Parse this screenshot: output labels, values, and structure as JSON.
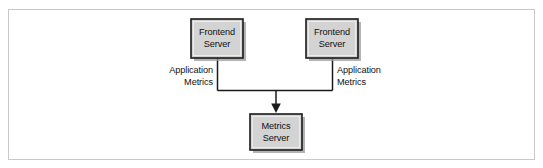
{
  "figure": {
    "type": "architecture-diagram",
    "background_color": "#ffffff",
    "frame_color": "#c9c9c9",
    "node_fill_color": "#d3d3d3",
    "node_border_color": "#1a1a1a",
    "edge_color": "#1a1a1a",
    "text_color": "#111111"
  },
  "nodes": {
    "frontend_server_left": {
      "line1": "Frontend",
      "line2": "Server"
    },
    "frontend_server_right": {
      "line1": "Frontend",
      "line2": "Server"
    },
    "metrics_server": {
      "line1": "Metrics",
      "line2": "Server"
    }
  },
  "edge_labels": {
    "left": {
      "line1": "Application",
      "line2": "Metrics"
    },
    "right": {
      "line1": "Application",
      "line2": "Metrics"
    }
  }
}
